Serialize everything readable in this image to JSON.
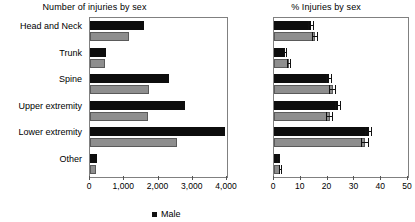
{
  "legend": {
    "male_label": "Male",
    "female_label": "Female",
    "male_color": "#111111",
    "female_color": "#8e8e8e"
  },
  "categories": [
    "Head and Neck",
    "Trunk",
    "Spine",
    "Upper extremity",
    "Lower extremity",
    "Other"
  ],
  "chart_data": [
    {
      "type": "bar",
      "orientation": "horizontal",
      "title": "Number of injuries by sex",
      "xlabel": "",
      "ylabel": "",
      "categories": [
        "Head and Neck",
        "Trunk",
        "Spine",
        "Upper extremity",
        "Lower extremity",
        "Other"
      ],
      "series": [
        {
          "name": "Male",
          "color": "#111111",
          "values": [
            1580,
            470,
            2300,
            2770,
            3940,
            200
          ]
        },
        {
          "name": "Female",
          "color": "#8e8e8e",
          "values": [
            1140,
            440,
            1720,
            1690,
            2540,
            180
          ]
        }
      ],
      "xlim": [
        0,
        4000
      ],
      "xticks": [
        0,
        1000,
        2000,
        3000,
        4000
      ],
      "xticklabels": [
        "0",
        "1,000",
        "2,000",
        "3,000",
        "4,000"
      ],
      "grid": false,
      "legend_position": "bottom"
    },
    {
      "type": "bar",
      "orientation": "horizontal",
      "title": "% Injuries by sex",
      "xlabel": "",
      "ylabel": "",
      "categories": [
        "Head and Neck",
        "Trunk",
        "Spine",
        "Upper extremity",
        "Lower extremity",
        "Other"
      ],
      "series": [
        {
          "name": "Male",
          "color": "#111111",
          "values": [
            13.8,
            4.2,
            20.5,
            23.8,
            35.4,
            1.8
          ],
          "errors": [
            1.0,
            0.6,
            1.2,
            1.2,
            1.3,
            0.5
          ]
        },
        {
          "name": "Female",
          "color": "#8e8e8e",
          "values": [
            15.3,
            5.6,
            22.0,
            20.8,
            34.0,
            2.3
          ],
          "errors": [
            1.2,
            0.8,
            1.3,
            1.3,
            1.4,
            0.6
          ]
        }
      ],
      "xlim": [
        0,
        50
      ],
      "xticks": [
        0,
        10,
        20,
        30,
        40,
        50
      ],
      "xticklabels": [
        "0",
        "10",
        "20",
        "30",
        "40",
        "50"
      ],
      "grid": false,
      "legend_position": "bottom"
    }
  ]
}
